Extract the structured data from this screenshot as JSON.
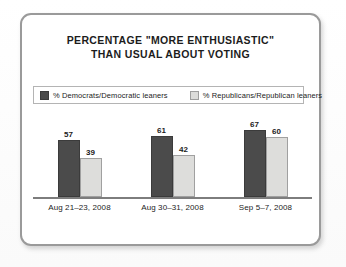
{
  "chart_data": {
    "type": "bar",
    "title": "PERCENTAGE \"MORE ENTHUSIASTIC\" THAN USUAL ABOUT VOTING",
    "title_lines": [
      "PERCENTAGE \"MORE ENTHUSIASTIC\"",
      "THAN USUAL ABOUT VOTING"
    ],
    "categories": [
      "Aug 21–23, 2008",
      "Aug 30–31, 2008",
      "Sep 5–7, 2008"
    ],
    "series": [
      {
        "name": "% Democrats/Democratic leaners",
        "color": "#4b4b4b",
        "values": [
          57,
          61,
          67
        ]
      },
      {
        "name": "% Republicans/Republican leaners",
        "color": "#dddddb",
        "values": [
          39,
          42,
          60
        ]
      }
    ],
    "xlabel": "",
    "ylabel": "",
    "ylim": [
      0,
      100
    ],
    "grid": false,
    "legend_position": "top",
    "axis_color": "#7d7d7d",
    "value_labels": true
  },
  "card": {
    "border_color": "#9a9a9a",
    "background": "#ffffff"
  }
}
